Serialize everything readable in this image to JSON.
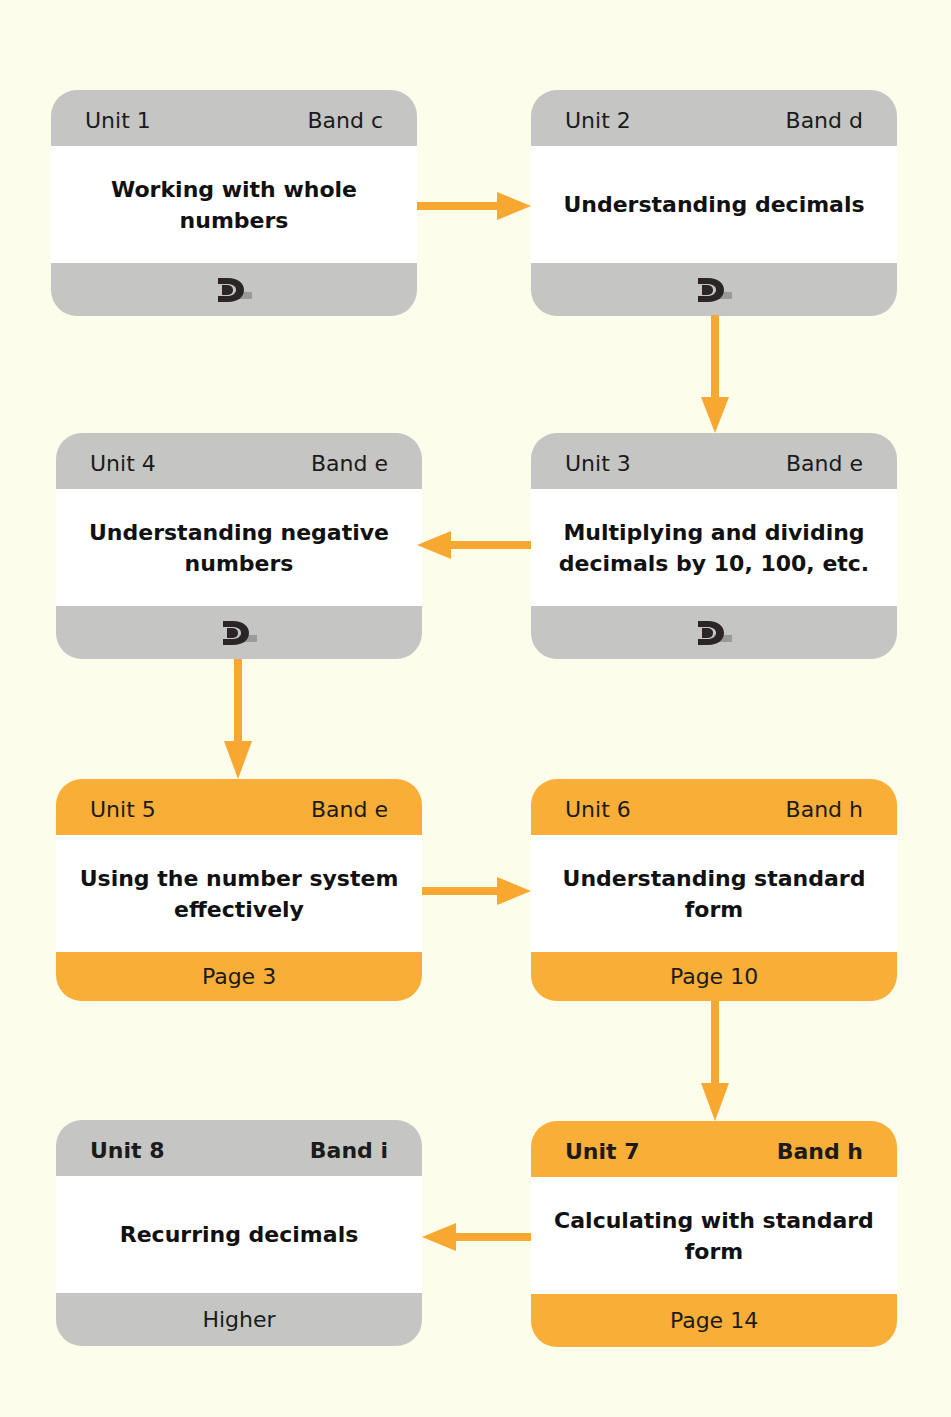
{
  "colors": {
    "background": "#fdfdeb",
    "grey_card": "#c5c5c3",
    "orange_card": "#f8ae37",
    "arrow": "#f8a830",
    "body": "#ffffff"
  },
  "units": [
    {
      "unit": "Unit 1",
      "band": "Band c",
      "title": "Working with whole numbers",
      "footer_type": "logo",
      "footer": "dl-logo-icon",
      "style": "grey"
    },
    {
      "unit": "Unit 2",
      "band": "Band d",
      "title": "Understanding decimals",
      "footer_type": "logo",
      "footer": "dl-logo-icon",
      "style": "grey"
    },
    {
      "unit": "Unit 3",
      "band": "Band e",
      "title": "Multiplying and dividing decimals by 10, 100, etc.",
      "footer_type": "logo",
      "footer": "dl-logo-icon",
      "style": "grey"
    },
    {
      "unit": "Unit 4",
      "band": "Band e",
      "title": "Understanding negative numbers",
      "footer_type": "logo",
      "footer": "dl-logo-icon",
      "style": "grey"
    },
    {
      "unit": "Unit 5",
      "band": "Band e",
      "title": "Using the number system effectively",
      "footer_type": "text",
      "footer": "Page 3",
      "style": "orange"
    },
    {
      "unit": "Unit 6",
      "band": "Band h",
      "title": "Understanding standard form",
      "footer_type": "text",
      "footer": "Page 10",
      "style": "orange"
    },
    {
      "unit": "Unit 7",
      "band": "Band h",
      "title": "Calculating with standard form",
      "footer_type": "text",
      "footer": "Page 14",
      "style": "orange"
    },
    {
      "unit": "Unit 8",
      "band": "Band i",
      "title": "Recurring decimals",
      "footer_type": "text",
      "footer": "Higher",
      "style": "grey"
    }
  ],
  "flow": [
    {
      "from": "Unit 1",
      "to": "Unit 2",
      "direction": "right"
    },
    {
      "from": "Unit 2",
      "to": "Unit 3",
      "direction": "down"
    },
    {
      "from": "Unit 3",
      "to": "Unit 4",
      "direction": "left"
    },
    {
      "from": "Unit 4",
      "to": "Unit 5",
      "direction": "down"
    },
    {
      "from": "Unit 5",
      "to": "Unit 6",
      "direction": "right"
    },
    {
      "from": "Unit 6",
      "to": "Unit 7",
      "direction": "down"
    },
    {
      "from": "Unit 7",
      "to": "Unit 8",
      "direction": "left"
    }
  ]
}
